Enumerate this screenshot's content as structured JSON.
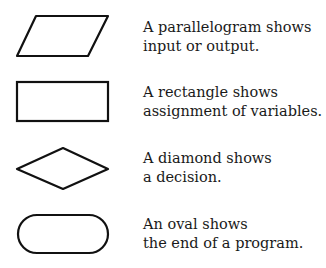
{
  "legend": [
    {
      "shape": "parallelogram",
      "line1": "A parallelogram shows",
      "line2": "input or output."
    },
    {
      "shape": "rectangle",
      "line1": "A rectangle shows",
      "line2": "assignment of variables."
    },
    {
      "shape": "diamond",
      "line1": "A diamond shows",
      "line2": "a decision."
    },
    {
      "shape": "oval",
      "line1": "An oval shows",
      "line2": "the end of a program."
    }
  ],
  "colors": {
    "stroke": "#111111",
    "background": "#ffffff"
  }
}
